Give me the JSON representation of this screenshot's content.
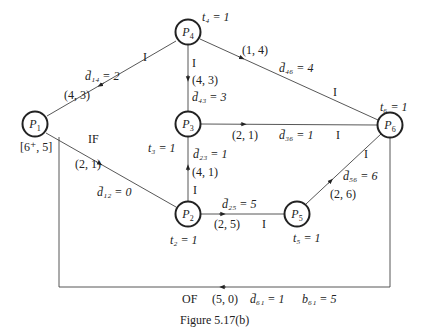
{
  "figure": {
    "caption": "Figure 5.17(b)",
    "nodes": [
      {
        "id": "P1",
        "name": "P",
        "sub": "1",
        "x": 35,
        "y": 124,
        "annotation": "[6⁺, 5]"
      },
      {
        "id": "P2",
        "name": "P",
        "sub": "2",
        "x": 188,
        "y": 214,
        "time_label": "t₂ = 1"
      },
      {
        "id": "P3",
        "name": "P",
        "sub": "3",
        "x": 188,
        "y": 124,
        "time_label": "t₃ = 1"
      },
      {
        "id": "P4",
        "name": "P",
        "sub": "4",
        "x": 188,
        "y": 32,
        "time_label": "t₄ = 1"
      },
      {
        "id": "P5",
        "name": "P",
        "sub": "5",
        "x": 297,
        "y": 214,
        "time_label": "t₅ = 1"
      },
      {
        "id": "P6",
        "name": "P",
        "sub": "6",
        "x": 390,
        "y": 125,
        "time_label": "t₆ = 1"
      }
    ],
    "edges": [
      {
        "from": "P4",
        "to": "P1",
        "pair": "(4, 3)",
        "delay": "d̄₁₄ = 2",
        "mark": "I"
      },
      {
        "from": "P1",
        "to": "P2",
        "pair": "(2, 1)",
        "delay": "d̄₁₂ = 0",
        "mark": "IF"
      },
      {
        "from": "P4",
        "to": "P3",
        "pair": "(4, 3)",
        "delay": "d̄₄₃ = 3",
        "mark": "I"
      },
      {
        "from": "P4",
        "to": "P6",
        "pair": "(1, 4)",
        "delay": "d̄₄₆ = 4",
        "mark": "I"
      },
      {
        "from": "P3",
        "to": "P6",
        "pair": "(2, 1)",
        "delay": "d̄₃₆ = 1",
        "mark": "I"
      },
      {
        "from": "P2",
        "to": "P3",
        "pair": "(4, 1)",
        "delay": "d̄₂₃ = 1",
        "mark": "I"
      },
      {
        "from": "P2",
        "to": "P5",
        "pair": "(2, 5)",
        "delay": "d̄₂₅ = 5",
        "mark": "I"
      },
      {
        "from": "P5",
        "to": "P6",
        "pair": "(2, 6)",
        "delay": "d̄₅₆ = 6",
        "mark": "I"
      },
      {
        "from": "P6",
        "to": "P1",
        "pair": "(5, 0)",
        "delay": "d̄₆₁ = 1",
        "mark": "OF",
        "buffer": "b₆₁ = 5"
      }
    ]
  },
  "labels": {
    "t4": "t₄ = 1",
    "t6": "t₆ = 1",
    "t3": "t₃ = 1",
    "t2": "t₂ = 1",
    "t5": "t₅ = 1",
    "p1_annot": "[6⁺, 5]",
    "e41_pair": "(4, 3)",
    "e41_delay": "d̄₁₄ = 2",
    "e41_mark": "I",
    "e12_pair": "(2, 1)",
    "e12_delay": "d̄₁₂ = 0",
    "e12_mark": "IF",
    "e43_pair": "(4, 3)",
    "e43_delay": "d̄₄₃ = 3",
    "e43_mark": "I",
    "e46_pair": "(1, 4)",
    "e46_delay": "d̄₄₆ = 4",
    "e46_mark": "I",
    "e36_pair": "(2, 1)",
    "e36_delay": "d̄₃₆ = 1",
    "e36_mark": "I",
    "e23_pair": "(4, 1)",
    "e23_delay": "d̄₂₃ = 1",
    "e23_mark": "I",
    "e25_pair": "(2, 5)",
    "e25_delay": "d̄₂₅ = 5",
    "e25_mark": "I",
    "e56_pair": "(2, 6)",
    "e56_delay": "d̄₅₆ = 6",
    "e56_mark": "I",
    "e61_mark": "OF",
    "e61_pair": "(5, 0)",
    "e61_delay": "d̄₆₁ = 1",
    "e61_buffer": "b₆₁ = 5",
    "caption": "Figure 5.17(b)"
  },
  "node_names": {
    "p": "P",
    "s1": "1",
    "s2": "2",
    "s3": "3",
    "s4": "4",
    "s5": "5",
    "s6": "6"
  }
}
